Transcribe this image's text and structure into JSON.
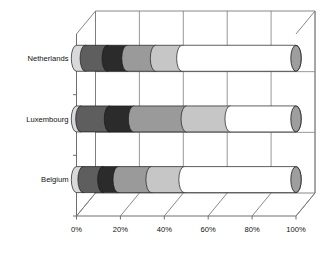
{
  "chart_data": {
    "type": "bar",
    "orientation": "horizontal",
    "stacked": true,
    "percent_stacked": true,
    "style": "3d-cylinder",
    "title": "",
    "subtitle": "",
    "xlabel": "",
    "ylabel": "",
    "xlim": [
      0,
      100
    ],
    "grid": true,
    "grid_axis": "x",
    "legend": "none",
    "categories": [
      "Netherlands",
      "Luxembourg",
      "Belgium"
    ],
    "category_order_top_to_bottom": [
      "Netherlands",
      "Luxembourg",
      "Belgium"
    ],
    "x_tick_labels": [
      "0%",
      "20%",
      "40%",
      "60%",
      "80%",
      "100%"
    ],
    "x_tick_values": [
      0,
      20,
      40,
      60,
      80,
      100
    ],
    "series": [
      {
        "name": "Segment 1",
        "color": "#d9d9d9",
        "values": [
          4,
          2,
          3
        ]
      },
      {
        "name": "Segment 2",
        "color": "#5e5e5e",
        "values": [
          10,
          13,
          9
        ]
      },
      {
        "name": "Segment 3",
        "color": "#2b2b2b",
        "values": [
          9,
          11,
          7
        ]
      },
      {
        "name": "Segment 4",
        "color": "#9a9a9a",
        "values": [
          13,
          24,
          15
        ]
      },
      {
        "name": "Segment 5",
        "color": "#c6c6c6",
        "values": [
          12,
          20,
          15
        ]
      },
      {
        "name": "Segment 6",
        "color": "#ffffff",
        "values": [
          52,
          30,
          51
        ]
      }
    ],
    "end_cap_color": "#9e9e9e",
    "plot_background": "#ffffff"
  },
  "axis": {
    "x_ticks": [
      {
        "label": "0%",
        "value": 0
      },
      {
        "label": "20%",
        "value": 20
      },
      {
        "label": "40%",
        "value": 40
      },
      {
        "label": "60%",
        "value": 60
      },
      {
        "label": "80%",
        "value": 80
      },
      {
        "label": "100%",
        "value": 100
      }
    ],
    "y_ticks": [
      {
        "label": "Netherlands"
      },
      {
        "label": "Luxembourg"
      },
      {
        "label": "Belgium"
      }
    ]
  }
}
